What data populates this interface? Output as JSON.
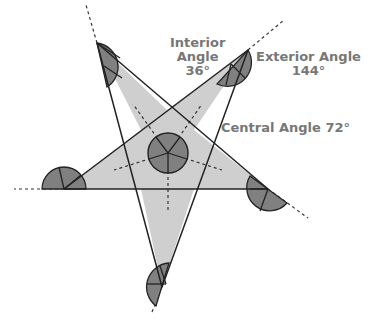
{
  "diagram": {
    "labels": {
      "interior_title_line1": "Interior",
      "interior_title_line2": "Angle",
      "interior_value": "36°",
      "exterior_title": "Exterior Angle",
      "exterior_value": "144°",
      "central": "Central Angle 72°"
    },
    "colors": {
      "star_fill": "#cfcfcf",
      "wedge_fill": "#808080",
      "line": "#2a2a2a",
      "label_text": "#777777",
      "background": "#ffffff"
    }
  }
}
